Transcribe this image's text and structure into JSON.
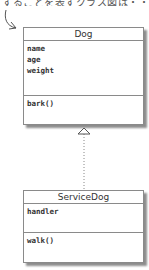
{
  "annotation": {
    "text": "することを表すクラス図は・・・"
  },
  "classes": [
    {
      "name": "Dog",
      "attributes": [
        "name",
        "age",
        "weight"
      ],
      "methods": [
        "bark()"
      ]
    },
    {
      "name": "ServiceDog",
      "attributes": [
        "handler"
      ],
      "methods": [
        "walk()"
      ]
    }
  ],
  "relationship": {
    "type": "inheritance",
    "from": "ServiceDog",
    "to": "Dog",
    "line_style": "dotted"
  },
  "colors": {
    "border": "#8a8a8a",
    "text": "#333333",
    "annotation": "#555555"
  }
}
